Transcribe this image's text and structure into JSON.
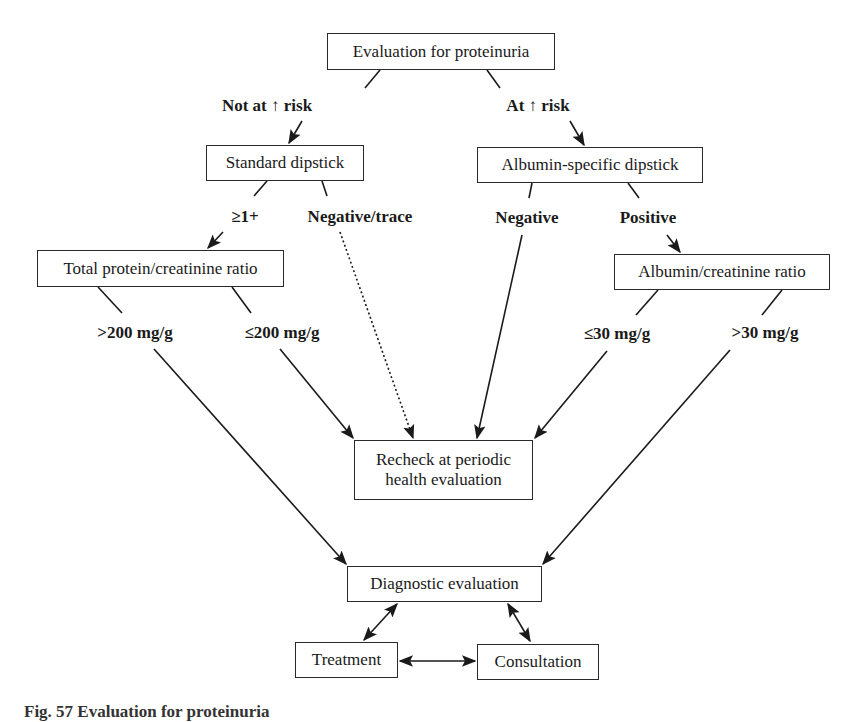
{
  "nodes": {
    "root": "Evaluation for proteinuria",
    "standard_dipstick": "Standard dipstick",
    "albumin_dipstick": "Albumin-specific dipstick",
    "total_protein_ratio": "Total protein/creatinine ratio",
    "albumin_ratio": "Albumin/creatinine ratio",
    "recheck": "Recheck at periodic health evaluation",
    "diagnostic": "Diagnostic evaluation",
    "treatment": "Treatment",
    "consultation": "Consultation"
  },
  "edge_labels": {
    "not_at_risk": "Not at ↑ risk",
    "at_risk": "At ↑ risk",
    "ge1": "≥1+",
    "neg_trace": "Negative/trace",
    "negative": "Negative",
    "positive": "Positive",
    "gt200": ">200 mg/g",
    "le200": "≤200 mg/g",
    "le30": "≤30 mg/g",
    "gt30": ">30 mg/g"
  },
  "caption": "Fig. 57   Evaluation for proteinuria"
}
